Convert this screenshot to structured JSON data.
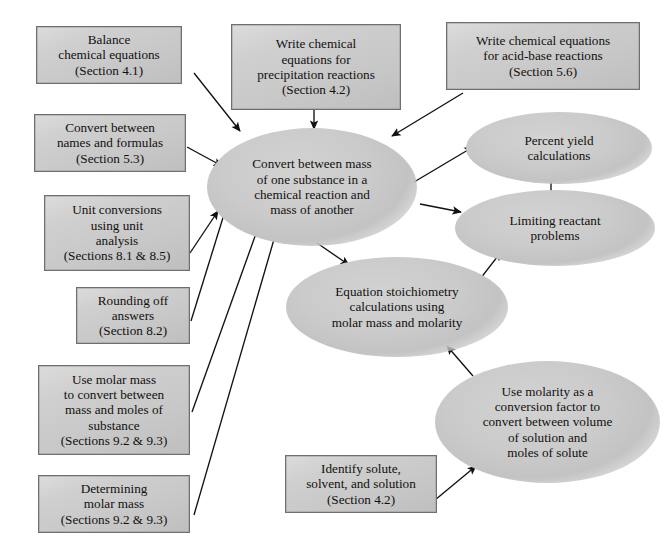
{
  "diagram": {
    "background_color": "#ffffff",
    "box_fill_color": "#cccccc",
    "box_border_color": "#6f6f6f",
    "ellipse_fill_color": "#c9c9c9",
    "arrow_color": "#111111",
    "text_color": "#12100e"
  },
  "nodes": {
    "balance_equations": {
      "label": "Balance\nchemical equations\n(Section 4.1)",
      "shape": "rectangle"
    },
    "names_formulas": {
      "label": "Convert between\nnames and formulas\n(Section 5.3)",
      "shape": "rectangle"
    },
    "unit_conversions": {
      "label": "Unit conversions\nusing unit\nanalysis\n(Sections 8.1 & 8.5)",
      "shape": "rectangle"
    },
    "rounding_off": {
      "label": "Rounding off\nanswers\n(Section 8.2)",
      "shape": "rectangle"
    },
    "molar_mass_convert": {
      "label": "Use molar mass\nto convert between\nmass and moles of\nsubstance\n(Sections 9.2 & 9.3)",
      "shape": "rectangle"
    },
    "determining_molar_mass": {
      "label": "Determining\nmolar mass\n(Sections 9.2 & 9.3)",
      "shape": "rectangle"
    },
    "precipitation_equations": {
      "label": "Write chemical\nequations for\nprecipitation reactions\n(Section 4.2)",
      "shape": "rectangle"
    },
    "acid_base_equations": {
      "label": "Write chemical equations\nfor acid-base reactions\n(Section 5.6)",
      "shape": "rectangle"
    },
    "identify_solute": {
      "label": "Identify solute,\nsolvent, and solution\n(Section 4.2)",
      "shape": "rectangle"
    },
    "convert_mass": {
      "label": "Convert between mass\nof one substance in a\nchemical reaction and\nmass of another",
      "shape": "ellipse"
    },
    "percent_yield": {
      "label": "Percent yield\ncalculations",
      "shape": "ellipse"
    },
    "limiting_reactant": {
      "label": "Limiting reactant\nproblems",
      "shape": "ellipse"
    },
    "equation_stoichiometry": {
      "label": "Equation stoichiometry\ncalculations using\nmolar mass and molarity",
      "shape": "ellipse"
    },
    "molarity_conversion": {
      "label": "Use molarity as a\nconversion factor to\nconvert between volume\nof solution and\nmoles of solute",
      "shape": "ellipse"
    }
  },
  "edges": [
    {
      "name": "balance-to-convert",
      "from": "balance_equations",
      "to": "convert_mass"
    },
    {
      "name": "names-to-convert",
      "from": "names_formulas",
      "to": "convert_mass"
    },
    {
      "name": "units-to-convert",
      "from": "unit_conversions",
      "to": "convert_mass"
    },
    {
      "name": "rounding-to-convert",
      "from": "rounding_off",
      "to": "convert_mass"
    },
    {
      "name": "molarmass-to-convert",
      "from": "molar_mass_convert",
      "to": "convert_mass"
    },
    {
      "name": "determining-to-convert",
      "from": "determining_molar_mass",
      "to": "convert_mass"
    },
    {
      "name": "precipitation-to-convert",
      "from": "precipitation_equations",
      "to": "convert_mass"
    },
    {
      "name": "acidbase-to-convert",
      "from": "acid_base_equations",
      "to": "convert_mass"
    },
    {
      "name": "convert-to-percent-yield",
      "from": "convert_mass",
      "to": "percent_yield"
    },
    {
      "name": "convert-to-limiting-reactant",
      "from": "convert_mass",
      "to": "limiting_reactant"
    },
    {
      "name": "convert-to-stoichiometry",
      "from": "convert_mass",
      "to": "equation_stoichiometry"
    },
    {
      "name": "limiting-to-percent-yield",
      "from": "limiting_reactant",
      "to": "percent_yield"
    },
    {
      "name": "stoichiometry-to-limiting-reactant",
      "from": "equation_stoichiometry",
      "to": "limiting_reactant"
    },
    {
      "name": "molarity-to-stoichiometry",
      "from": "molarity_conversion",
      "to": "equation_stoichiometry"
    },
    {
      "name": "solute-to-molarity",
      "from": "identify_solute",
      "to": "molarity_conversion"
    }
  ]
}
